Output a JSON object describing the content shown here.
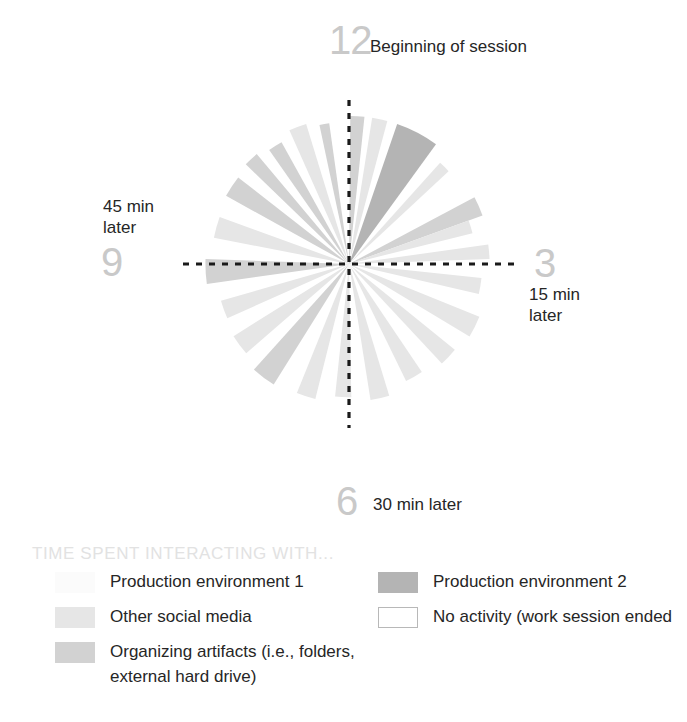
{
  "chart_data": {
    "type": "pie",
    "title": "TIME SPENT INTERACTING WITH...",
    "subtype": "polar-time-wedges",
    "xlabel": "",
    "ylabel": "",
    "center": {
      "x": 349,
      "y": 264
    },
    "radius": 148,
    "axis_labels": [
      {
        "id": "12",
        "numeral": "12",
        "note": "Beginning of session",
        "angle_deg": 0
      },
      {
        "id": "3",
        "numeral": "3",
        "note": "15 min later",
        "angle_deg": 90
      },
      {
        "id": "6",
        "numeral": "6",
        "note": "30 min later",
        "angle_deg": 180
      },
      {
        "id": "9",
        "numeral": "9",
        "note": "45 min later",
        "angle_deg": 270
      }
    ],
    "categories": [
      "Production environment 1",
      "Production environment 2",
      "Other social media",
      "Organizing artifacts (i.e., folders, external hard drive)",
      "No activity (work session ended"
    ],
    "colors": {
      "production_environment_1": "#fbfbfb",
      "production_environment_2": "#b4b4b4",
      "other_social_media": "#e6e6e6",
      "organizing_artifacts": "#d2d2d2",
      "no_activity": "#ffffff",
      "axis_line": "#1a1a1a",
      "clock_numeral": "#c9c9c9",
      "legend_title": "#e2e2e2",
      "text": "#262626"
    },
    "wedges": [
      {
        "start_deg": 0.5,
        "end_deg": 6.0,
        "category": "organizing_artifacts",
        "radius_pct": 100
      },
      {
        "start_deg": 6.0,
        "end_deg": 9.0,
        "category": "no_activity",
        "radius_pct": 100
      },
      {
        "start_deg": 9.0,
        "end_deg": 15.0,
        "category": "other_social_media",
        "radius_pct": 100
      },
      {
        "start_deg": 15.0,
        "end_deg": 19.0,
        "category": "no_activity",
        "radius_pct": 100
      },
      {
        "start_deg": 19.0,
        "end_deg": 36.0,
        "category": "production_environment_2",
        "radius_pct": 100
      },
      {
        "start_deg": 36.0,
        "end_deg": 42.0,
        "category": "no_activity",
        "radius_pct": 100
      },
      {
        "start_deg": 42.0,
        "end_deg": 47.0,
        "category": "other_social_media",
        "radius_pct": 92
      },
      {
        "start_deg": 47.0,
        "end_deg": 62.0,
        "category": "no_activity",
        "radius_pct": 100
      },
      {
        "start_deg": 62.0,
        "end_deg": 70.0,
        "category": "organizing_artifacts",
        "radius_pct": 96
      },
      {
        "start_deg": 70.0,
        "end_deg": 76.0,
        "category": "other_social_media",
        "radius_pct": 86
      },
      {
        "start_deg": 76.0,
        "end_deg": 82.0,
        "category": "no_activity",
        "radius_pct": 100
      },
      {
        "start_deg": 82.0,
        "end_deg": 88.0,
        "category": "other_social_media",
        "radius_pct": 95
      },
      {
        "start_deg": 88.0,
        "end_deg": 96.0,
        "category": "no_activity",
        "radius_pct": 100
      },
      {
        "start_deg": 96.0,
        "end_deg": 103.0,
        "category": "other_social_media",
        "radius_pct": 90
      },
      {
        "start_deg": 103.0,
        "end_deg": 112.0,
        "category": "no_activity",
        "radius_pct": 100
      },
      {
        "start_deg": 112.0,
        "end_deg": 121.0,
        "category": "other_social_media",
        "radius_pct": 95
      },
      {
        "start_deg": 121.0,
        "end_deg": 129.0,
        "category": "no_activity",
        "radius_pct": 100
      },
      {
        "start_deg": 129.0,
        "end_deg": 137.0,
        "category": "other_social_media",
        "radius_pct": 92
      },
      {
        "start_deg": 137.0,
        "end_deg": 146.0,
        "category": "no_activity",
        "radius_pct": 100
      },
      {
        "start_deg": 146.0,
        "end_deg": 154.0,
        "category": "other_social_media",
        "radius_pct": 88
      },
      {
        "start_deg": 154.0,
        "end_deg": 163.0,
        "category": "no_activity",
        "radius_pct": 100
      },
      {
        "start_deg": 163.0,
        "end_deg": 171.0,
        "category": "other_social_media",
        "radius_pct": 93
      },
      {
        "start_deg": 171.0,
        "end_deg": 179.0,
        "category": "no_activity",
        "radius_pct": 100
      },
      {
        "start_deg": 179.0,
        "end_deg": 186.0,
        "category": "other_social_media",
        "radius_pct": 90
      },
      {
        "start_deg": 186.0,
        "end_deg": 194.0,
        "category": "no_activity",
        "radius_pct": 100
      },
      {
        "start_deg": 194.0,
        "end_deg": 202.0,
        "category": "other_social_media",
        "radius_pct": 94
      },
      {
        "start_deg": 202.0,
        "end_deg": 212.0,
        "category": "no_activity",
        "radius_pct": 100
      },
      {
        "start_deg": 212.0,
        "end_deg": 222.0,
        "category": "organizing_artifacts",
        "radius_pct": 96
      },
      {
        "start_deg": 222.0,
        "end_deg": 229.0,
        "category": "no_activity",
        "radius_pct": 100
      },
      {
        "start_deg": 229.0,
        "end_deg": 238.0,
        "category": "other_social_media",
        "radius_pct": 92
      },
      {
        "start_deg": 238.0,
        "end_deg": 246.0,
        "category": "no_activity",
        "radius_pct": 100
      },
      {
        "start_deg": 246.0,
        "end_deg": 254.0,
        "category": "other_social_media",
        "radius_pct": 90
      },
      {
        "start_deg": 254.0,
        "end_deg": 262.0,
        "category": "no_activity",
        "radius_pct": 100
      },
      {
        "start_deg": 262.0,
        "end_deg": 272.0,
        "category": "organizing_artifacts",
        "radius_pct": 97
      },
      {
        "start_deg": 272.0,
        "end_deg": 281.0,
        "category": "no_activity",
        "radius_pct": 100
      },
      {
        "start_deg": 281.0,
        "end_deg": 290.0,
        "category": "other_social_media",
        "radius_pct": 93
      },
      {
        "start_deg": 290.0,
        "end_deg": 299.0,
        "category": "no_activity",
        "radius_pct": 100
      },
      {
        "start_deg": 299.0,
        "end_deg": 308.0,
        "category": "organizing_artifacts",
        "radius_pct": 95
      },
      {
        "start_deg": 308.0,
        "end_deg": 314.0,
        "category": "no_activity",
        "radius_pct": 100
      },
      {
        "start_deg": 314.0,
        "end_deg": 320.0,
        "category": "organizing_artifacts",
        "radius_pct": 97
      },
      {
        "start_deg": 320.0,
        "end_deg": 325.0,
        "category": "no_activity",
        "radius_pct": 100
      },
      {
        "start_deg": 325.0,
        "end_deg": 331.0,
        "category": "organizing_artifacts",
        "radius_pct": 94
      },
      {
        "start_deg": 331.0,
        "end_deg": 336.0,
        "category": "no_activity",
        "radius_pct": 100
      },
      {
        "start_deg": 336.0,
        "end_deg": 343.0,
        "category": "other_social_media",
        "radius_pct": 99
      },
      {
        "start_deg": 343.0,
        "end_deg": 348.0,
        "category": "no_activity",
        "radius_pct": 100
      },
      {
        "start_deg": 348.0,
        "end_deg": 352.0,
        "category": "organizing_artifacts",
        "radius_pct": 96
      },
      {
        "start_deg": 352.0,
        "end_deg": 360.0,
        "category": "no_activity",
        "radius_pct": 100
      }
    ]
  },
  "clock": {
    "twelve": {
      "numeral": "12",
      "note": "Beginning of session"
    },
    "three": {
      "numeral": "3",
      "note": "15 min later"
    },
    "six": {
      "numeral": "6",
      "note": "30 min later"
    },
    "nine": {
      "numeral": "9",
      "note": "45 min later"
    }
  },
  "legend": {
    "title": "TIME SPENT INTERACTING WITH...",
    "left_column": [
      {
        "label": "Production environment 1",
        "color": "#fbfbfb",
        "outlined": false
      },
      {
        "label": "Other social media",
        "color": "#e6e6e6",
        "outlined": false
      },
      {
        "label": "Organizing artifacts (i.e., folders, external hard drive)",
        "color": "#d2d2d2",
        "outlined": false
      }
    ],
    "right_column": [
      {
        "label": "Production environment 2",
        "color": "#b4b4b4",
        "outlined": false
      },
      {
        "label": "No activity (work session ended",
        "color": "#ffffff",
        "outlined": true
      }
    ]
  }
}
